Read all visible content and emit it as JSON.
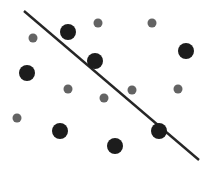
{
  "figure": {
    "name": "scatter-plot-with-separating-line",
    "width": 216,
    "height": 175,
    "background": "#ffffff",
    "title": "",
    "xlabel": "",
    "ylabel": "",
    "legend": []
  },
  "chart_data": {
    "type": "scatter",
    "title": "",
    "subtitle": "",
    "xlabel": "",
    "ylabel": "",
    "xlim": [
      0,
      216
    ],
    "ylim": [
      0,
      175
    ],
    "grid": false,
    "axes_visible": false,
    "tick_labels_x": [],
    "tick_labels_y": [],
    "legend_position": "none",
    "annotations": [
      {
        "name": "decision-boundary-line",
        "type": "line",
        "x1": 24,
        "y1": 11,
        "x2": 199,
        "y2": 160,
        "color": "#262626",
        "width": 2.4
      }
    ],
    "series": [
      {
        "name": "large-dark-points",
        "marker": "circle",
        "color": "#1c1c1c",
        "size": 8,
        "points": [
          {
            "id": "p-dark-1",
            "x": 68,
            "y": 32
          },
          {
            "id": "p-dark-2",
            "x": 95,
            "y": 61
          },
          {
            "id": "p-dark-3",
            "x": 186,
            "y": 51
          },
          {
            "id": "p-dark-4",
            "x": 27,
            "y": 73
          },
          {
            "id": "p-dark-5",
            "x": 60,
            "y": 131
          },
          {
            "id": "p-dark-6",
            "x": 115,
            "y": 146
          },
          {
            "id": "p-dark-7",
            "x": 159,
            "y": 131
          }
        ]
      },
      {
        "name": "small-gray-points",
        "marker": "circle",
        "color": "#636363",
        "size": 4.5,
        "points": [
          {
            "id": "p-gray-1",
            "x": 33,
            "y": 38
          },
          {
            "id": "p-gray-2",
            "x": 98,
            "y": 23
          },
          {
            "id": "p-gray-3",
            "x": 152,
            "y": 23
          },
          {
            "id": "p-gray-4",
            "x": 68,
            "y": 89
          },
          {
            "id": "p-gray-5",
            "x": 104,
            "y": 98
          },
          {
            "id": "p-gray-6",
            "x": 132,
            "y": 90
          },
          {
            "id": "p-gray-7",
            "x": 178,
            "y": 89
          },
          {
            "id": "p-gray-8",
            "x": 17,
            "y": 118
          }
        ]
      }
    ],
    "colors": {
      "dark_marker": "#1c1c1c",
      "gray_marker": "#636363",
      "line": "#262626",
      "background": "#ffffff"
    }
  }
}
